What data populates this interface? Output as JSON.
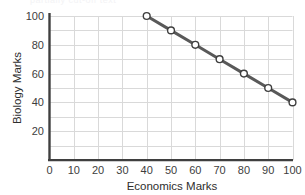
{
  "chart_data": {
    "type": "line",
    "title": "",
    "xlabel": "Economics Marks",
    "ylabel": "Biology Marks",
    "xlim": [
      0,
      100
    ],
    "ylim": [
      0,
      100
    ],
    "xticks": [
      0,
      10,
      20,
      30,
      40,
      50,
      60,
      70,
      80,
      90,
      100
    ],
    "xtick_labels": [
      "0",
      "10",
      "20",
      "30",
      "40",
      "50",
      "60",
      "70",
      "80",
      "90",
      "100"
    ],
    "yticks": [
      20,
      40,
      60,
      80,
      100
    ],
    "ytick_labels": [
      "20",
      "40",
      "60",
      "80",
      "100"
    ],
    "y_gridline_step": 10,
    "x_gridline_step": 10,
    "grid": true,
    "legend": "none",
    "series": [
      {
        "name": "Biology vs Economics",
        "marker": "open-circle",
        "line_color": "#595959",
        "marker_edge_color": "#3f3f3f",
        "marker_face_color": "#ffffff",
        "x": [
          40,
          50,
          60,
          70,
          80,
          90,
          100
        ],
        "y": [
          100,
          90,
          80,
          70,
          60,
          50,
          40
        ],
        "points": [
          {
            "x": 40,
            "y": 100
          },
          {
            "x": 50,
            "y": 90
          },
          {
            "x": 60,
            "y": 80
          },
          {
            "x": 70,
            "y": 70
          },
          {
            "x": 80,
            "y": 60
          },
          {
            "x": 90,
            "y": 50
          },
          {
            "x": 100,
            "y": 40
          }
        ]
      }
    ]
  },
  "style": {
    "background": "#ffffff",
    "grid_color": "#d9d9d9",
    "axis_color": "#3f3f3f",
    "text_color": "#3d3d3d"
  },
  "clipped_header_text": "partially cut-off text"
}
